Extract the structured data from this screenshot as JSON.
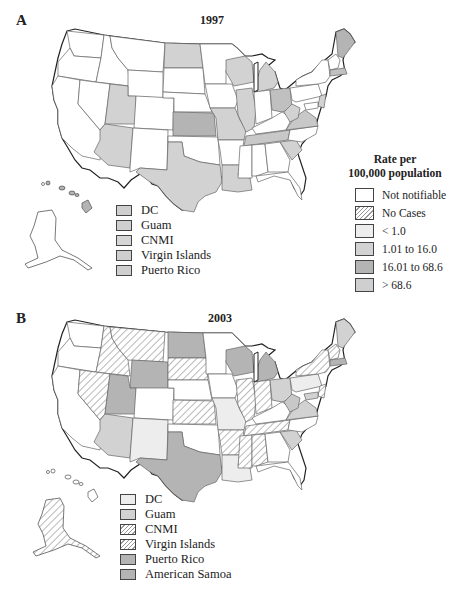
{
  "colors": {
    "not_notifiable": "#ffffff",
    "lt_1": "#ededed",
    "r1_16": "#d2d2d2",
    "r16_68": "#b4b4b4",
    "gt_68": "#cfcfcf",
    "stroke": "#555555",
    "outline": "#222222"
  },
  "panel_a": {
    "letter": "A",
    "year": "1997",
    "territories": [
      {
        "label": "DC",
        "fill": "#cfcfcf"
      },
      {
        "label": "Guam",
        "fill": "#cfcfcf"
      },
      {
        "label": "CNMI",
        "fill": "#d6d6d6"
      },
      {
        "label": "Virgin Islands",
        "fill": "#cfcfcf"
      },
      {
        "label": "Puerto Rico",
        "fill": "#cfcfcf"
      }
    ]
  },
  "rate_legend": {
    "title_line1": "Rate per",
    "title_line2": "100,000 population",
    "items": [
      {
        "label": "Not notifiable",
        "style": "white"
      },
      {
        "label": "No Cases",
        "style": "hatch"
      },
      {
        "label": "< 1.0",
        "style": "lt_1"
      },
      {
        "label": "1.01 to 16.0",
        "style": "r1_16"
      },
      {
        "label": "16.01 to 68.6",
        "style": "r16_68"
      },
      {
        "label": "> 68.6",
        "style": "gt_68"
      }
    ]
  },
  "panel_b": {
    "letter": "B",
    "year": "2003",
    "territories": [
      {
        "label": "DC",
        "style": "lt_1"
      },
      {
        "label": "Guam",
        "style": "r1_16"
      },
      {
        "label": "CNMI",
        "style": "hatch"
      },
      {
        "label": "Virgin Islands",
        "style": "hatch"
      },
      {
        "label": "Puerto Rico",
        "style": "r16_68"
      },
      {
        "label": "American Samoa",
        "style": "r16_68"
      }
    ]
  }
}
